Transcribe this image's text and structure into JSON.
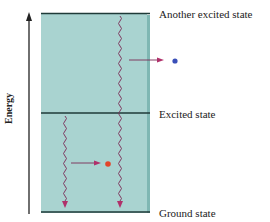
{
  "axis": {
    "label": "Energy",
    "direction": "up"
  },
  "levels": [
    {
      "name": "Another excited state",
      "position": "top"
    },
    {
      "name": "Excited state",
      "position": "middle"
    },
    {
      "name": "Ground state",
      "position": "bottom"
    }
  ],
  "transitions": [
    {
      "from": "Another excited state",
      "to": "Ground state",
      "emitted_photon_color": "#3a4fb8",
      "photon": "blue"
    },
    {
      "from": "Excited state",
      "to": "Ground state",
      "emitted_photon_color": "#e2452a",
      "photon": "red"
    }
  ],
  "colors": {
    "box_fill": "#a9d3d0",
    "box_side": "#7fb7b3",
    "level_line": "#1f3a38",
    "wave": "#7a2a55",
    "arrow": "#b0306a",
    "blue_dot": "#3a4fb8",
    "red_dot": "#e2452a"
  }
}
